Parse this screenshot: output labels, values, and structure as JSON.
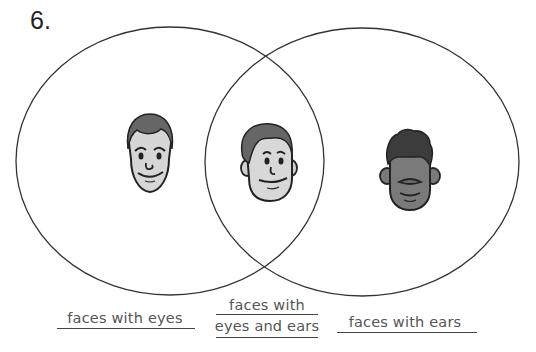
{
  "question": {
    "number": "6."
  },
  "diagram": {
    "type": "venn",
    "sets": [
      {
        "label": "faces with eyes"
      },
      {
        "label": "faces with ears"
      }
    ],
    "intersection": {
      "label_line1": "faces with",
      "label_line2": "eyes and ears"
    },
    "faces": [
      {
        "region": "left-only",
        "description": "face with eyes, no ears"
      },
      {
        "region": "intersection",
        "description": "face with eyes and ears"
      },
      {
        "region": "right-only",
        "description": "face with ears, no eyes"
      }
    ],
    "colors": {
      "outline": "#333333",
      "skin_light": "#d9d9d9",
      "hair": "#6a6a6a",
      "skin_dark": "#7a7a7a",
      "hair_dark": "#3a3a3a"
    }
  }
}
